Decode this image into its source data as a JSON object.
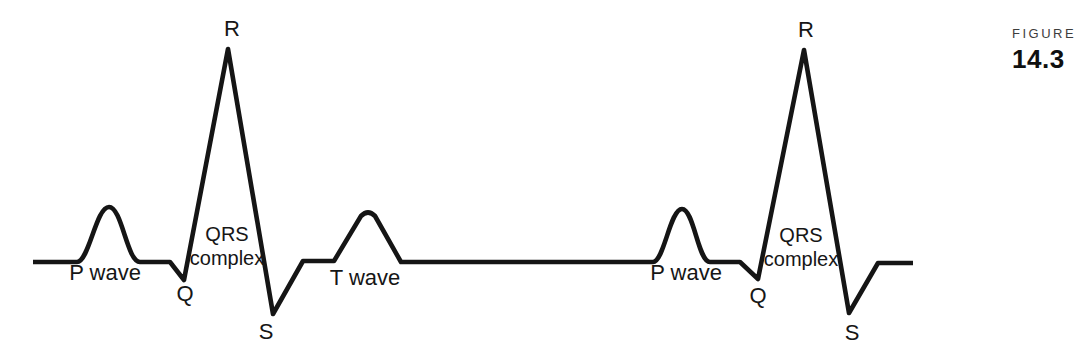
{
  "figure": {
    "kicker": "FIGURE",
    "number": "14.3",
    "kicker_color": "#3d3d3d",
    "number_color": "#101010"
  },
  "diagram": {
    "trace": {
      "stroke_color": "#151515",
      "stroke_width": "4.6",
      "path": "M 33 262 H 77 C 89 262 96 207 109 207 C 122 207 127 262 140 262 H 170 L 184 280 L 228 49 L 273 314 L 303 261 H 334 L 361 216 Q 368 209 375 216 L 401 262 H 653 C 664 262 670 209 682 209 C 694 209 698 262 710 262 H 740 L 758 279 L 804 50 L 849 313 L 878 263 H 913"
    },
    "labels": {
      "r1": "R",
      "p_wave_1": "P wave",
      "q1": "Q",
      "qrs1_line1": "QRS",
      "qrs1_line2": "complex",
      "s1": "S",
      "t_wave": "T wave",
      "p_wave_2": "P wave",
      "q2": "Q",
      "qrs2_line1": "QRS",
      "qrs2_line2": "complex",
      "r2": "R",
      "s2": "S"
    }
  },
  "chart_data": {
    "type": "line",
    "xlabel": "",
    "ylabel": "",
    "grid": false,
    "legend": false,
    "series": [
      {
        "name": "cycle-1",
        "landmarks": [
          {
            "label": "baseline-start",
            "x": 33,
            "y": 262
          },
          {
            "label": "P-wave-peak",
            "x": 109,
            "y": 207
          },
          {
            "label": "Q-trough",
            "x": 184,
            "y": 280
          },
          {
            "label": "R-peak",
            "x": 228,
            "y": 49
          },
          {
            "label": "S-trough",
            "x": 273,
            "y": 314
          },
          {
            "label": "T-wave-peak",
            "x": 368,
            "y": 212
          }
        ]
      },
      {
        "name": "cycle-2",
        "landmarks": [
          {
            "label": "P-wave-peak",
            "x": 682,
            "y": 209
          },
          {
            "label": "Q-trough",
            "x": 758,
            "y": 279
          },
          {
            "label": "R-peak",
            "x": 804,
            "y": 50
          },
          {
            "label": "S-trough",
            "x": 849,
            "y": 313
          },
          {
            "label": "baseline-end",
            "x": 913,
            "y": 263
          }
        ]
      }
    ]
  }
}
